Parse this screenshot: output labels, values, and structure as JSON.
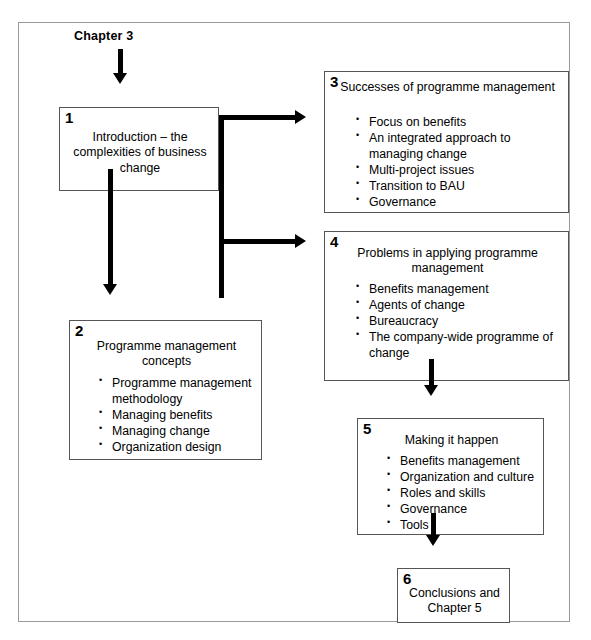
{
  "diagram": {
    "top_label": "Chapter 3",
    "nodes": [
      {
        "number": "1",
        "title": "Introduction – the complexities of business change",
        "bullets": []
      },
      {
        "number": "2",
        "title": "Programme management concepts",
        "bullets": [
          "Programme management methodology",
          "Managing benefits",
          "Managing change",
          "Organization design"
        ]
      },
      {
        "number": "3",
        "title": "Successes of programme management",
        "bullets": [
          "Focus on benefits",
          "An integrated approach to managing change",
          "Multi-project issues",
          "Transition to BAU",
          "Governance"
        ]
      },
      {
        "number": "4",
        "title": "Problems in applying programme management",
        "bullets": [
          "Benefits management",
          "Agents of change",
          "Bureaucracy",
          "The company-wide programme of change"
        ]
      },
      {
        "number": "5",
        "title": "Making it happen",
        "bullets": [
          "Benefits management",
          "Organization and culture",
          "Roles and skills",
          "Governance",
          "Tools"
        ]
      },
      {
        "number": "6",
        "title": "Conclusions and Chapter 5",
        "bullets": []
      }
    ],
    "colors": {
      "frame_border": "#9a9a9a",
      "node_border": "#555555",
      "connector": "#000000",
      "text": "#000000",
      "background": "#ffffff"
    }
  }
}
